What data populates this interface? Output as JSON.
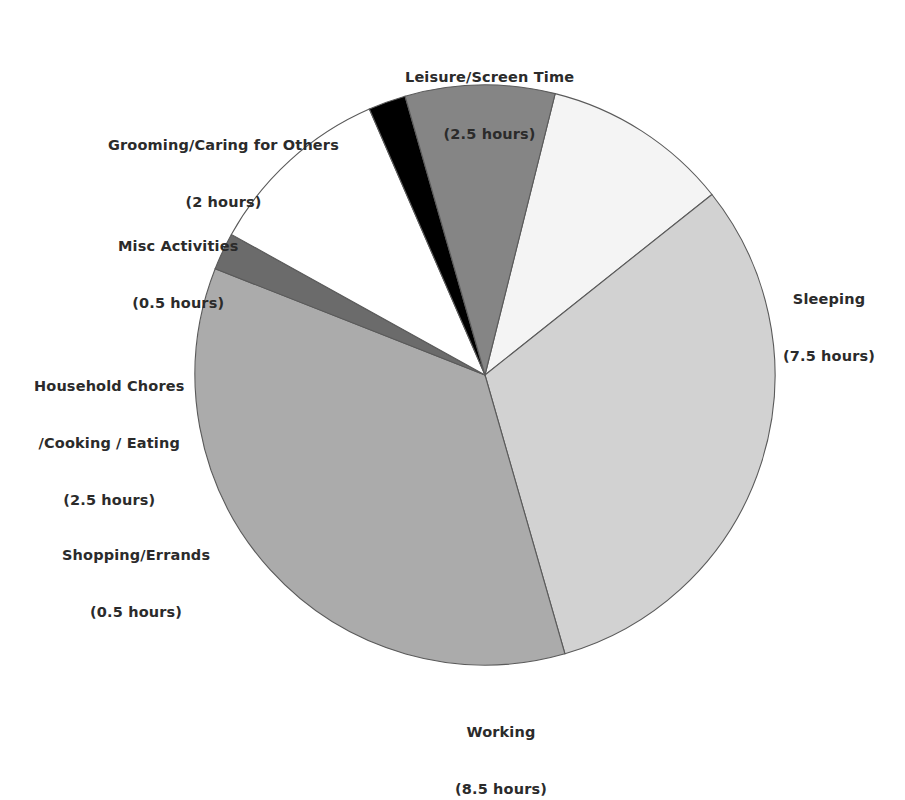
{
  "chart_data": {
    "type": "pie",
    "title": "",
    "subtitle": "",
    "xlabel": "",
    "ylabel": "",
    "units": "hours",
    "total": 24,
    "legend_position": "none",
    "grid": false,
    "labels_outside": true,
    "start_angle_deg": -76,
    "direction": "clockwise",
    "center": {
      "x": 485,
      "y": 375
    },
    "radius": 290,
    "categories": [
      "Leisure/Screen Time",
      "Sleeping",
      "Working",
      "Shopping/Errands",
      "Household Chores /Cooking / Eating",
      "Misc Activities",
      "Grooming/Caring for Others"
    ],
    "values": [
      2.5,
      7.5,
      8.5,
      0.5,
      2.5,
      0.5,
      2
    ],
    "colors": [
      "#f4f4f4",
      "#d2d2d2",
      "#ababab",
      "#6b6b6b",
      "#ffffff",
      "#000000",
      "#858585"
    ],
    "slices": [
      {
        "name": "Leisure/Screen Time",
        "value": 2.5,
        "value_text": "(2.5 hours)",
        "percent": 10.4,
        "color": "#f4f4f4",
        "label_lines": [
          "Leisure/Screen Time",
          "(2.5 hours)"
        ]
      },
      {
        "name": "Sleeping",
        "value": 7.5,
        "value_text": "(7.5 hours)",
        "percent": 31.3,
        "color": "#d2d2d2",
        "label_lines": [
          "Sleeping",
          "(7.5 hours)"
        ]
      },
      {
        "name": "Working",
        "value": 8.5,
        "value_text": "(8.5 hours)",
        "percent": 35.4,
        "color": "#ababab",
        "label_lines": [
          "Working",
          "(8.5 hours)"
        ]
      },
      {
        "name": "Shopping/Errands",
        "value": 0.5,
        "value_text": "(0.5 hours)",
        "percent": 2.1,
        "color": "#6b6b6b",
        "label_lines": [
          "Shopping/Errands",
          "(0.5 hours)"
        ]
      },
      {
        "name": "Household Chores /Cooking / Eating",
        "value": 2.5,
        "value_text": "(2.5 hours)",
        "percent": 10.4,
        "color": "#ffffff",
        "label_lines": [
          "Household Chores",
          "/Cooking / Eating",
          "(2.5 hours)"
        ]
      },
      {
        "name": "Misc Activities",
        "value": 0.5,
        "value_text": "(0.5 hours)",
        "percent": 2.1,
        "color": "#000000",
        "label_lines": [
          "Misc Activities",
          "(0.5 hours)"
        ]
      },
      {
        "name": "Grooming/Caring for Others",
        "value": 2,
        "value_text": "(2 hours)",
        "percent": 8.3,
        "color": "#858585",
        "label_lines": [
          "Grooming/Caring for Others",
          "(2 hours)"
        ]
      }
    ]
  },
  "labels": {
    "leisure": {
      "line1": "Leisure/Screen Time",
      "line2": "(2.5 hours)"
    },
    "grooming": {
      "line1": "Grooming/Caring for Others",
      "line2": "(2 hours)"
    },
    "misc": {
      "line1": "Misc Activities",
      "line2": "(0.5 hours)"
    },
    "household": {
      "line1": "Household Chores",
      "line2": "/Cooking / Eating",
      "line3": "(2.5 hours)"
    },
    "shopping": {
      "line1": "Shopping/Errands",
      "line2": "(0.5 hours)"
    },
    "working": {
      "line1": "Working",
      "line2": "(8.5 hours)"
    },
    "sleeping": {
      "line1": "Sleeping",
      "line2": "(7.5 hours)"
    }
  },
  "style": {
    "background": "#ffffff",
    "label_color": "#2b2b2b",
    "slice_outline": "#5a5a5a"
  }
}
